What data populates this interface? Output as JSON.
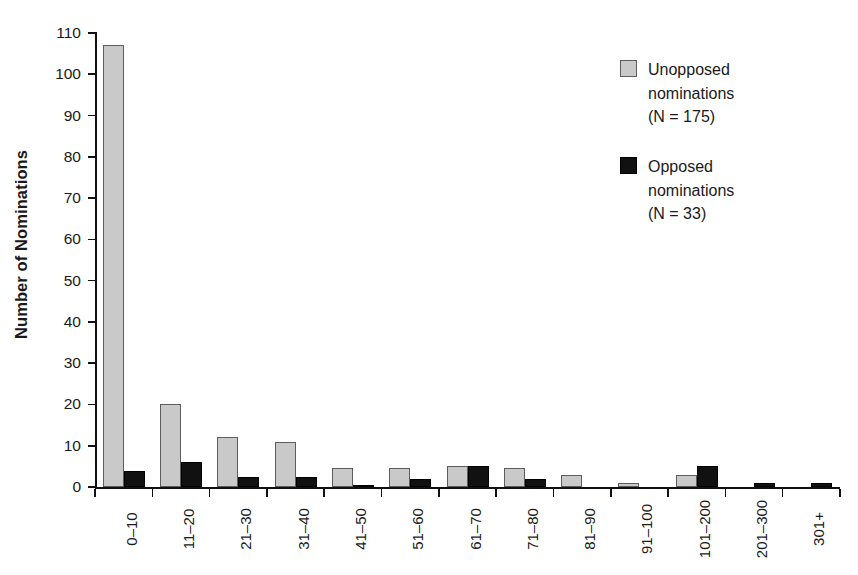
{
  "chart_data": {
    "type": "bar",
    "title": "",
    "xlabel": "",
    "ylabel": "Number of Nominations",
    "ylim": [
      0,
      110
    ],
    "yticks": [
      0,
      10,
      20,
      30,
      40,
      50,
      60,
      70,
      80,
      90,
      100,
      110
    ],
    "grid": false,
    "legend_position": "top-right",
    "categories": [
      "0–10",
      "11–20",
      "21–30",
      "31–40",
      "41–50",
      "51–60",
      "61–70",
      "71–80",
      "81–90",
      "91–100",
      "101–200",
      "201–300",
      "301+"
    ],
    "series": [
      {
        "name": "Unopposed nominations",
        "n": 175,
        "color": "#c9c9c9",
        "values": [
          107,
          20,
          12,
          11,
          4.5,
          4.5,
          5,
          4.5,
          3,
          1,
          3,
          0,
          0
        ]
      },
      {
        "name": "Opposed nominations",
        "n": 33,
        "color": "#111111",
        "values": [
          4,
          6,
          2.5,
          2.5,
          0.5,
          2,
          5,
          2,
          0,
          0,
          5,
          1,
          1
        ]
      }
    ]
  },
  "legend": {
    "entries": [
      {
        "label_line1": "Unopposed",
        "label_line2": "nominations",
        "label_line3": "(N = 175)",
        "swatch": "unopposed-swatch"
      },
      {
        "label_line1": "Opposed",
        "label_line2": "nominations",
        "label_line3": "(N = 33)",
        "swatch": "opposed-swatch"
      }
    ]
  },
  "axes": {
    "y_title": "Number of Nominations",
    "y_tick_labels": [
      "0",
      "10",
      "20",
      "30",
      "40",
      "50",
      "60",
      "70",
      "80",
      "90",
      "100",
      "110"
    ],
    "x_tick_labels": [
      "0–10",
      "11–20",
      "21–30",
      "31–40",
      "41–50",
      "51–60",
      "61–70",
      "71–80",
      "81–90",
      "91–100",
      "101–200",
      "201–300",
      "301+"
    ]
  }
}
